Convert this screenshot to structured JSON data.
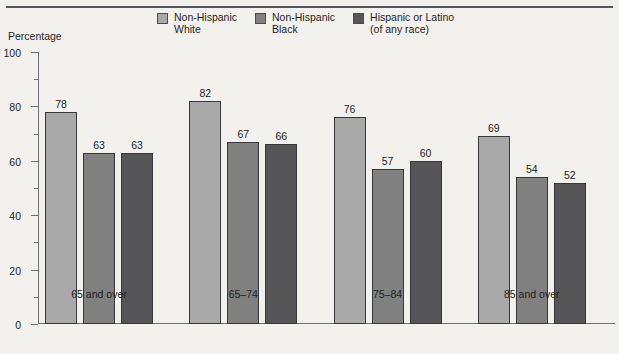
{
  "figure": {
    "clipped_title_fragment": "",
    "y_axis_title": "Percentage"
  },
  "legend": {
    "items": [
      {
        "label_line1": "Non-Hispanic",
        "label_line2": "White",
        "color": "#a9a9a9"
      },
      {
        "label_line1": "Non-Hispanic",
        "label_line2": "Black",
        "color": "#808080"
      },
      {
        "label_line1": "Hispanic or Latino",
        "label_line2": "(of any race)",
        "color": "#555558"
      }
    ]
  },
  "chart_data": {
    "type": "bar",
    "title": "",
    "xlabel": "",
    "ylabel": "Percentage",
    "ylim": [
      0,
      100
    ],
    "ytick_labels": [
      "0",
      "20",
      "40",
      "60",
      "80",
      "100"
    ],
    "ytick_values": [
      0,
      20,
      40,
      60,
      80,
      100
    ],
    "yminor_values": [
      10,
      30,
      50,
      70,
      90
    ],
    "grid": false,
    "legend_position": "top",
    "categories": [
      "65 and over",
      "65–74",
      "75–84",
      "85 and over"
    ],
    "series": [
      {
        "name": "Non-Hispanic White",
        "color": "#a9a9a9",
        "values": [
          78,
          82,
          76,
          69
        ]
      },
      {
        "name": "Non-Hispanic Black",
        "color": "#808080",
        "values": [
          63,
          67,
          57,
          54
        ]
      },
      {
        "name": "Hispanic or Latino (of any race)",
        "color": "#555558",
        "values": [
          63,
          66,
          60,
          52
        ]
      }
    ]
  }
}
